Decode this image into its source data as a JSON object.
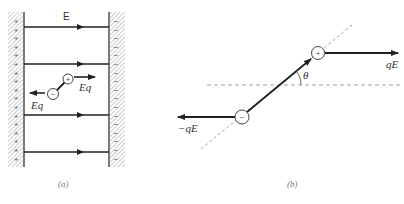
{
  "figure": {
    "panel_a": {
      "caption": "(a)",
      "field_label": "E",
      "force_label_right": "Eq",
      "force_label_left": "Eq",
      "positive_charge_symbol": "+",
      "negative_charge_symbol": "−",
      "left_plate_sign": "+",
      "right_plate_sign": "−",
      "left_plate_sign_count": 17,
      "right_plate_sign_count": 17,
      "field_line_count": 4
    },
    "panel_b": {
      "caption": "(b)",
      "force_label_right": "qE",
      "force_label_left": "−qE",
      "angle_label": "θ",
      "positive_charge_symbol": "+",
      "negative_charge_symbol": "−"
    },
    "colors": {
      "ink": "#222222",
      "dash": "#888888",
      "hatch": "#999999",
      "caption": "#777777"
    }
  }
}
